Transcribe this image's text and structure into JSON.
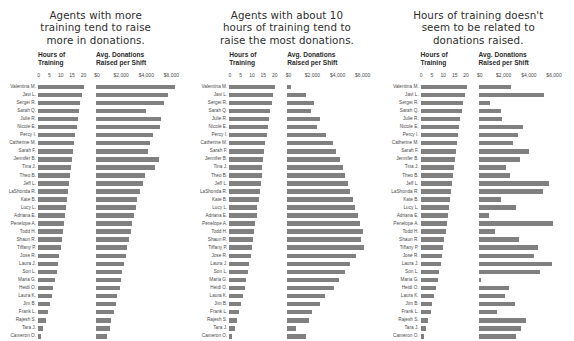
{
  "columns": {
    "hours_header_line1": "Hours of",
    "hours_header_line2": "Training",
    "donations_header_line1": "Avg. Donations",
    "donations_header_line2": "Raised per Shift",
    "hours_ticks": [
      "0",
      "5",
      "10",
      "15",
      "20"
    ],
    "hours_tick_values": [
      0,
      5,
      10,
      15,
      20
    ],
    "donations_ticks": [
      "$0",
      "$2,000",
      "$4,000",
      "$6,000"
    ],
    "donations_tick_values": [
      0,
      2000,
      4000,
      6000
    ],
    "hours_axis_max": 22,
    "donations_axis_max": 7000
  },
  "agents": [
    "Valentina M.",
    "Javi L.",
    "Sergei R.",
    "Sarah Q.",
    "Julie R.",
    "Nicole E.",
    "Percy I.",
    "Catherine M.",
    "Sarah F.",
    "Jennifer B.",
    "Tina J.",
    "Theo B.",
    "Jeff L.",
    "LaShonda R.",
    "Kate B.",
    "Lucy L.",
    "Adriana E.",
    "Penelope A.",
    "Todd H.",
    "Shaun R.",
    "Tiffany P.",
    "Jose R.",
    "Laura J.",
    "Son L.",
    "Maria G.",
    "Heidi O.",
    "Laura K.",
    "Jim B.",
    "Frank L.",
    "Rajesh S.",
    "Tara J.",
    "Cameron O."
  ],
  "panels": [
    {
      "id": "positive-correlation",
      "title_lines": [
        "Agents with more",
        "training tend to raise",
        "more in donations."
      ],
      "chart_data": {
        "type": "bar",
        "title": "Agents with more training tend to raise more in donations.",
        "xlabel": "",
        "ylabel": "",
        "categories": [
          "Valentina M.",
          "Javi L.",
          "Sergei R.",
          "Sarah Q.",
          "Julie R.",
          "Nicole E.",
          "Percy I.",
          "Catherine M.",
          "Sarah F.",
          "Jennifer B.",
          "Tina J.",
          "Theo B.",
          "Jeff L.",
          "LaShonda R.",
          "Kate B.",
          "Lucy L.",
          "Adriana E.",
          "Penelope A.",
          "Todd H.",
          "Shaun R.",
          "Tiffany P.",
          "Jose R.",
          "Laura J.",
          "Son L.",
          "Maria G.",
          "Heidi O.",
          "Laura K.",
          "Jim B.",
          "Frank L.",
          "Rajesh S.",
          "Tara J.",
          "Cameron O."
        ],
        "series": [
          {
            "name": "Hours of Training",
            "xlim": [
              0,
              22
            ],
            "values": [
              20.2,
              19.4,
              18.6,
              18.0,
              17.5,
              17.0,
              16.4,
              15.9,
              15.4,
              15.0,
              14.6,
              14.2,
              13.8,
              13.3,
              12.9,
              12.4,
              12.0,
              11.5,
              11.0,
              10.5,
              10.0,
              9.4,
              8.8,
              8.2,
              7.5,
              6.8,
              6.0,
              5.2,
              4.4,
              3.4,
              2.4,
              1.4
            ]
          },
          {
            "name": "Avg. Donations Raised per Shift",
            "xlim": [
              0,
              7000
            ],
            "values": [
              6300,
              5700,
              5400,
              4000,
              5200,
              5100,
              4500,
              4300,
              4100,
              5000,
              4700,
              3900,
              3700,
              3500,
              3300,
              3200,
              3000,
              2900,
              2800,
              2600,
              2500,
              2400,
              2200,
              2100,
              2000,
              1900,
              1700,
              1600,
              1400,
              1200,
              1100,
              900
            ]
          }
        ],
        "grid": false,
        "legend": "none"
      }
    },
    {
      "id": "inverted-u-correlation",
      "title_lines": [
        "Agents with about 10",
        "hours of training tend to",
        "raise the most donations."
      ],
      "chart_data": {
        "type": "bar",
        "title": "Agents with about 10 hours of training tend to raise the most donations.",
        "xlabel": "",
        "ylabel": "",
        "categories": [
          "Valentina M.",
          "Javi L.",
          "Sergei R.",
          "Sarah Q.",
          "Julie R.",
          "Nicole E.",
          "Percy I.",
          "Catherine M.",
          "Sarah F.",
          "Jennifer B.",
          "Tina J.",
          "Theo B.",
          "Jeff L.",
          "LaShonda R.",
          "Kate B.",
          "Lucy L.",
          "Adriana E.",
          "Penelope A.",
          "Todd H.",
          "Shaun R.",
          "Tiffany P.",
          "Jose R.",
          "Laura J.",
          "Son L.",
          "Maria G.",
          "Heidi O.",
          "Laura K.",
          "Jim B.",
          "Frank L.",
          "Rajesh S.",
          "Tara J.",
          "Cameron O."
        ],
        "series": [
          {
            "name": "Hours of Training",
            "xlim": [
              0,
              22
            ],
            "values": [
              20.2,
              19.4,
              18.6,
              18.0,
              17.5,
              17.0,
              16.4,
              15.9,
              15.4,
              15.0,
              14.6,
              14.2,
              13.8,
              13.3,
              12.9,
              12.4,
              12.0,
              11.5,
              11.0,
              10.5,
              10.0,
              9.4,
              8.8,
              8.2,
              7.5,
              6.8,
              6.0,
              5.2,
              4.4,
              3.4,
              2.4,
              1.4
            ]
          },
          {
            "name": "Avg. Donations Raised per Shift",
            "xlim": [
              0,
              7000
            ],
            "values": [
              300,
              1500,
              2100,
              1900,
              2600,
              2400,
              3100,
              3600,
              3900,
              4200,
              4400,
              4600,
              4800,
              5000,
              5200,
              5400,
              5600,
              5800,
              6000,
              5900,
              6100,
              5500,
              5000,
              4600,
              4100,
              3700,
              3000,
              2600,
              2000,
              1700,
              700,
              1500
            ]
          }
        ],
        "grid": false,
        "legend": "none"
      }
    },
    {
      "id": "no-correlation",
      "title_lines": [
        "Hours of training doesn't",
        "seem to be related to",
        "donations raised."
      ],
      "chart_data": {
        "type": "bar",
        "title": "Hours of training doesn't seem to be related to donations raised.",
        "xlabel": "",
        "ylabel": "",
        "categories": [
          "Valentina M.",
          "Javi L.",
          "Sergei R.",
          "Sarah Q.",
          "Julie R.",
          "Nicole E.",
          "Percy I.",
          "Catherine M.",
          "Sarah F.",
          "Jennifer B.",
          "Tina J.",
          "Theo B.",
          "Jeff L.",
          "LaShonda R.",
          "Kate B.",
          "Lucy L.",
          "Adriana E.",
          "Penelope A.",
          "Todd H.",
          "Shaun R.",
          "Tiffany P.",
          "Jose R.",
          "Laura J.",
          "Son L.",
          "Maria G.",
          "Heidi O.",
          "Laura K.",
          "Jim B.",
          "Frank L.",
          "Rajesh S.",
          "Tara J.",
          "Cameron O."
        ],
        "series": [
          {
            "name": "Hours of Training",
            "xlim": [
              0,
              22
            ],
            "values": [
              20.2,
              19.4,
              18.6,
              18.0,
              17.5,
              17.0,
              16.4,
              15.9,
              15.4,
              15.0,
              14.6,
              14.2,
              13.8,
              13.3,
              12.9,
              12.4,
              12.0,
              11.5,
              11.0,
              10.5,
              10.0,
              9.4,
              8.8,
              8.2,
              7.5,
              6.8,
              6.0,
              5.2,
              4.4,
              3.4,
              2.4,
              1.4
            ]
          },
          {
            "name": "Avg. Donations Raised per Shift",
            "xlim": [
              0,
              7000
            ],
            "values": [
              2600,
              5200,
              900,
              1800,
              1900,
              3500,
              3100,
              2700,
              4000,
              3300,
              2200,
              2500,
              5600,
              5100,
              1800,
              3000,
              800,
              5900,
              1300,
              3200,
              4700,
              4400,
              5800,
              4900,
              200,
              2400,
              2100,
              2900,
              1500,
              3800,
              3400,
              3000
            ]
          }
        ],
        "grid": false,
        "legend": "none"
      }
    }
  ]
}
